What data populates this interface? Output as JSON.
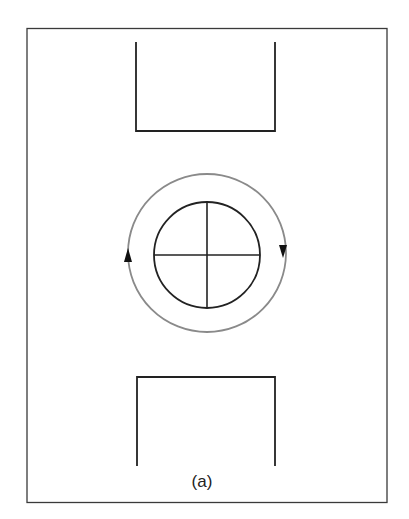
{
  "figure": {
    "label": "(a)",
    "colors": {
      "frame": "#3a3a3a",
      "shapes": "#222222",
      "rotation_path": "#8a8a8a",
      "arrows": "#111111",
      "background": "#ffffff"
    },
    "elements": {
      "frame": "outer rectangular border",
      "top_channel": "open-top U-shaped bracket",
      "bottom_channel": "open-bottom inverted U-shaped bracket",
      "rotor": "circle divided into four quadrants by crosshairs",
      "rotation_ring": "gray circular path around rotor",
      "arrows": [
        "up-arrow on left side",
        "down-arrow on right side"
      ],
      "rotation_direction": "clockwise"
    }
  }
}
